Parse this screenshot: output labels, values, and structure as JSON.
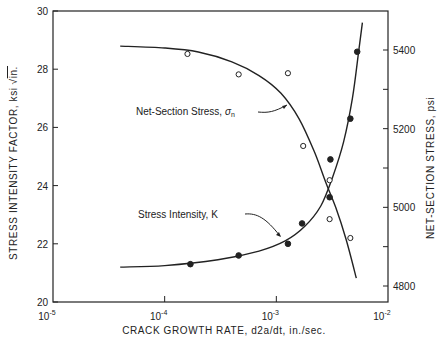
{
  "chart_data": {
    "type": "line",
    "title": "",
    "xlabel": "CRACK GROWTH RATE, d2a/dt, in./sec.",
    "ylabel": "STRESS INTENSITY FACTOR, ksi√in.",
    "y2label": "NET-SECTION STRESS, psi",
    "xscale": "log",
    "xlim": [
      1e-05,
      0.01
    ],
    "ylim": [
      20,
      30
    ],
    "y2lim": [
      4770,
      5500
    ],
    "grid": false,
    "x_ticks": [
      {
        "value": 1e-05,
        "label": "10",
        "exp": "-5"
      },
      {
        "value": 0.0001,
        "label": "10",
        "exp": "-4"
      },
      {
        "value": 0.001,
        "label": "10",
        "exp": "-3"
      },
      {
        "value": 0.01,
        "label": "10",
        "exp": "-2"
      }
    ],
    "y_ticks": [
      20,
      22,
      24,
      26,
      28,
      30
    ],
    "y2_ticks": [
      4800,
      4900,
      5000,
      5100,
      5200,
      5300,
      5400
    ],
    "y2_tick_labels": [
      "4800",
      "",
      "5000",
      "",
      "5200",
      "",
      "5400"
    ],
    "series": [
      {
        "name": "Stress Intensity, K",
        "axis": "left",
        "marker": "filled-circle",
        "points": [
          {
            "x": 0.00017,
            "y": 21.3
          },
          {
            "x": 0.00046,
            "y": 21.6
          },
          {
            "x": 0.00127,
            "y": 22.0
          },
          {
            "x": 0.0017,
            "y": 22.7
          },
          {
            "x": 0.003,
            "y": 23.6
          },
          {
            "x": 0.00305,
            "y": 24.9
          },
          {
            "x": 0.0046,
            "y": 26.3
          },
          {
            "x": 0.0053,
            "y": 28.6
          }
        ],
        "curve": [
          {
            "x": 4e-05,
            "y": 21.2
          },
          {
            "x": 0.0001,
            "y": 21.25
          },
          {
            "x": 0.0003,
            "y": 21.45
          },
          {
            "x": 0.0007,
            "y": 21.75
          },
          {
            "x": 0.0012,
            "y": 22.1
          },
          {
            "x": 0.0018,
            "y": 22.6
          },
          {
            "x": 0.0025,
            "y": 23.3
          },
          {
            "x": 0.0032,
            "y": 24.3
          },
          {
            "x": 0.004,
            "y": 25.5
          },
          {
            "x": 0.0048,
            "y": 27.0
          },
          {
            "x": 0.0055,
            "y": 28.7
          },
          {
            "x": 0.0059,
            "y": 29.6
          }
        ]
      },
      {
        "name": "Net-Section Stress, σn",
        "axis": "right",
        "marker": "open-circle",
        "points": [
          {
            "x": 0.00016,
            "y": 5390
          },
          {
            "x": 0.00046,
            "y": 5338
          },
          {
            "x": 0.00127,
            "y": 5341
          },
          {
            "x": 0.00174,
            "y": 5156
          },
          {
            "x": 0.003,
            "y": 5069
          },
          {
            "x": 0.003,
            "y": 4970
          },
          {
            "x": 0.0046,
            "y": 4922
          }
        ],
        "curve": [
          {
            "x": 4e-05,
            "y": 5410
          },
          {
            "x": 0.0001,
            "y": 5405
          },
          {
            "x": 0.0002,
            "y": 5395
          },
          {
            "x": 0.0004,
            "y": 5370
          },
          {
            "x": 0.0007,
            "y": 5335
          },
          {
            "x": 0.0011,
            "y": 5290
          },
          {
            "x": 0.0016,
            "y": 5225
          },
          {
            "x": 0.0022,
            "y": 5140
          },
          {
            "x": 0.0028,
            "y": 5060
          },
          {
            "x": 0.0034,
            "y": 5000
          },
          {
            "x": 0.0042,
            "y": 4920
          },
          {
            "x": 0.0052,
            "y": 4820
          }
        ]
      }
    ],
    "annotations": [
      {
        "text": "Net-Section Stress, ",
        "symbol": "σ",
        "sub": "n",
        "target_series": "Net-Section Stress, σn"
      },
      {
        "text": "Stress Intensity, K",
        "target_series": "Stress Intensity, K"
      }
    ]
  },
  "labels": {
    "xlabel": "CRACK GROWTH RATE, d2a/dt, in./sec.",
    "ylabel": "STRESS INTENSITY FACTOR, ksi",
    "ylabel_unit": "in.",
    "y2label": "NET-SECTION STRESS, psi",
    "annot_net_prefix": "Net-Section Stress, ",
    "annot_net_symbol": "σ",
    "annot_net_sub": "n",
    "annot_k": "Stress Intensity, K"
  },
  "colors": {
    "ink": "#222222",
    "background": "#ffffff"
  }
}
